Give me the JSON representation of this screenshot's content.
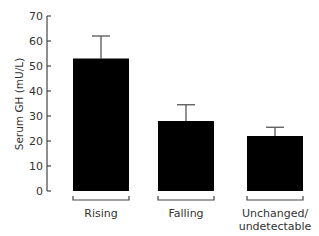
{
  "chart_data": {
    "type": "bar",
    "title": "",
    "xlabel": "",
    "ylabel": "Serum GH (mU/L)",
    "ylim": [
      0,
      70
    ],
    "yticks": [
      0,
      10,
      20,
      30,
      40,
      50,
      60,
      70
    ],
    "grid": false,
    "legend": null,
    "categories": [
      "Rising",
      "Falling",
      "Unchanged/\nundetectable"
    ],
    "category_lines": [
      [
        "Rising"
      ],
      [
        "Falling"
      ],
      [
        "Unchanged/",
        "undetectable"
      ]
    ],
    "values": [
      53,
      28,
      22
    ],
    "error_upper": [
      62,
      34.5,
      25.5
    ],
    "colors": {
      "bar": "#000000",
      "axis": "#444444",
      "error": "#555555"
    }
  }
}
